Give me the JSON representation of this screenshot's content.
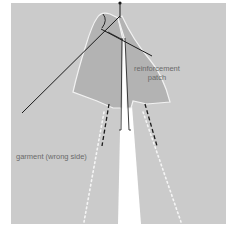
{
  "labels": {
    "patch_line1": "reinforcement",
    "patch_line2": "patch",
    "garment": "garment (wrong side)"
  },
  "colors": {
    "background": "#ffffff",
    "garment": "#cbcbcb",
    "patch": "#b3b3b3",
    "slit": "#ffffff",
    "ink": "#1a1a1a",
    "text": "#6a6a6a"
  }
}
